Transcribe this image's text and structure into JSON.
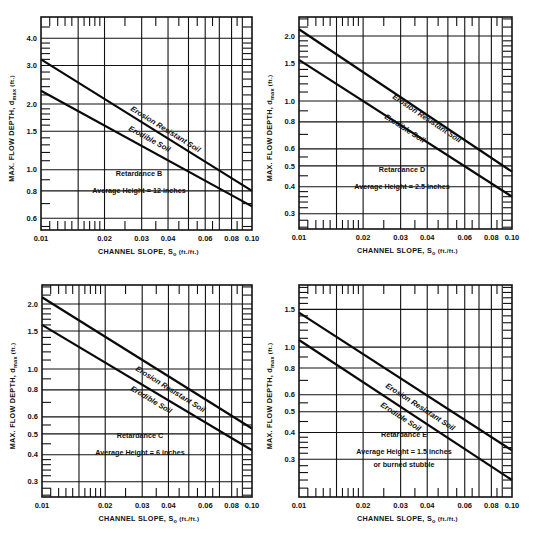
{
  "chart_data": [
    {
      "type": "line",
      "title": "Retardance B",
      "annotation": [
        "Retardance B",
        "Average Height  =  12 inches"
      ],
      "xlabel": "CHANNEL SLOPE, S",
      "xlabel_sub": "o",
      "xlabel_unit": "(ft./ft.)",
      "ylabel": "MAX. FLOW DEPTH, d",
      "ylabel_sub": "max",
      "ylabel_unit": "(ft.)",
      "xscale": "log",
      "yscale": "log",
      "xlim": [
        0.01,
        0.1
      ],
      "ylim": [
        0.5,
        5.0
      ],
      "x_ticks": [
        "0.01",
        "0.02",
        "0.03",
        "0.04",
        "0.06",
        "0.08",
        "0.10"
      ],
      "y_ticks": [
        "0.6",
        "0.8",
        "1.0",
        "1.5",
        "2.0",
        "3.0",
        "4.0"
      ],
      "x": [
        0.01,
        0.1
      ],
      "series": [
        {
          "name": "Erosion Resistant Soil",
          "values": [
            3.2,
            0.8
          ]
        },
        {
          "name": "Erodible Soil",
          "values": [
            2.3,
            0.68
          ]
        }
      ],
      "grid": true
    },
    {
      "type": "line",
      "title": "Retardance D",
      "annotation": [
        "Retardance D",
        "Average Height  =  2.5 inches"
      ],
      "xlabel": "CHANNEL SLOPE, S",
      "xlabel_sub": "o",
      "xlabel_unit": "(ft./ft.)",
      "ylabel": "MAX. FLOW DEPTH, d",
      "ylabel_sub": "max",
      "ylabel_unit": "(ft.)",
      "xscale": "log",
      "yscale": "log",
      "xlim": [
        0.01,
        0.1
      ],
      "ylim": [
        0.25,
        2.5
      ],
      "x_ticks": [
        "0.01",
        "0.02",
        "0.03",
        "0.04",
        "0.06",
        "0.08",
        "0.10"
      ],
      "y_ticks": [
        "0.3",
        "0.4",
        "0.5",
        "0.6",
        "0.8",
        "1.0",
        "1.5",
        "2.0"
      ],
      "x": [
        0.01,
        0.1
      ],
      "series": [
        {
          "name": "Erosion Resistant Soil",
          "values": [
            2.15,
            0.47
          ]
        },
        {
          "name": "Erodible Soil",
          "values": [
            1.55,
            0.36
          ]
        }
      ],
      "grid": true
    },
    {
      "type": "line",
      "title": "Retardance C",
      "annotation": [
        "Retardance C",
        "Average Height  =  6 inches"
      ],
      "xlabel": "CHANNEL SLOPE, S",
      "xlabel_sub": "o",
      "xlabel_unit": "(ft./ft.)",
      "ylabel": "MAX. FLOW DEPTH, d",
      "ylabel_sub": "max",
      "ylabel_unit": "(ft.)",
      "xscale": "log",
      "yscale": "log",
      "xlim": [
        0.01,
        0.1
      ],
      "ylim": [
        0.25,
        2.5
      ],
      "x_ticks": [
        "0.01",
        "0.02",
        "0.03",
        "0.04",
        "0.06",
        "0.08",
        "0.10"
      ],
      "y_ticks": [
        "0.3",
        "0.4",
        "0.5",
        "0.6",
        "0.8",
        "1.0",
        "1.5",
        "2.0"
      ],
      "x": [
        0.01,
        0.1
      ],
      "series": [
        {
          "name": "Erosion Resistant Soil",
          "values": [
            2.15,
            0.53
          ]
        },
        {
          "name": "Erodible Soil",
          "values": [
            1.6,
            0.42
          ]
        }
      ],
      "grid": true
    },
    {
      "type": "line",
      "title": "Retardance E",
      "annotation": [
        "Retardance E",
        "Average Height  =  1.5 inches",
        "or burned stubble"
      ],
      "xlabel": "CHANNEL SLOPE, S",
      "xlabel_sub": "o",
      "xlabel_unit": "(ft./ft.)",
      "ylabel": "MAX. FLOW DEPTH, d",
      "ylabel_sub": "max",
      "ylabel_unit": "(ft.)",
      "xscale": "log",
      "yscale": "log",
      "xlim": [
        0.01,
        0.1
      ],
      "ylim": [
        0.2,
        2.0
      ],
      "x_ticks": [
        "0.01",
        "0.02",
        "0.03",
        "0.04",
        "0.06",
        "0.08",
        "0.10"
      ],
      "y_ticks": [
        "0.3",
        "0.4",
        "0.5",
        "0.6",
        "0.8",
        "1.0",
        "1.5"
      ],
      "x": [
        0.01,
        0.1
      ],
      "series": [
        {
          "name": "Erosion Resistant Soil",
          "values": [
            1.45,
            0.33
          ]
        },
        {
          "name": "Erodible Soil",
          "values": [
            1.08,
            0.24
          ]
        }
      ],
      "grid": true
    }
  ],
  "layout": {
    "panels": [
      {
        "left": 41,
        "top": 17,
        "right": 252,
        "bottom": 230,
        "ytop": 5.0,
        "ybottom": 0.53,
        "label_pos": [
          [
            130,
            110
          ],
          [
            128,
            130
          ]
        ],
        "note_pos": [
          97,
          188
        ]
      },
      {
        "left": 299,
        "top": 17,
        "right": 512,
        "bottom": 229,
        "ytop": 2.45,
        "ybottom": 0.255,
        "label_pos": [
          [
            392,
            98
          ],
          [
            384,
            118
          ]
        ],
        "note_pos": [
          360,
          184
        ]
      },
      {
        "left": 42,
        "top": 285,
        "right": 252,
        "bottom": 497,
        "ytop": 2.45,
        "ybottom": 0.255,
        "label_pos": [
          [
            135,
            370
          ],
          [
            130,
            390
          ]
        ],
        "note_pos": [
          98,
          450
        ]
      },
      {
        "left": 299,
        "top": 285,
        "right": 512,
        "bottom": 497,
        "ytop": 1.95,
        "ybottom": 0.2,
        "label_pos": [
          [
            385,
            387
          ],
          [
            380,
            406
          ]
        ],
        "note_pos": [
          362,
          449
        ]
      }
    ]
  }
}
